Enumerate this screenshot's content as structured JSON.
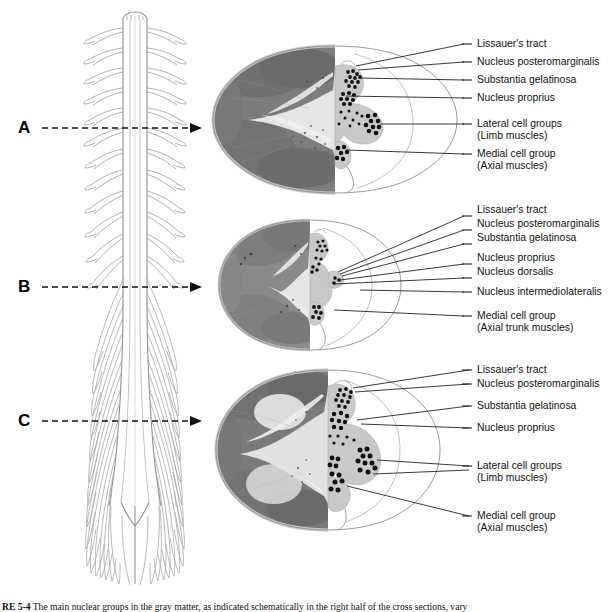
{
  "figure": {
    "caption_number": "RE 5-4",
    "caption_text": "The main nuclear groups in the gray matter, as indicated schematically in the right half of the cross sections, vary"
  },
  "levels": [
    {
      "id": "A",
      "letter": "A",
      "name": "cervical-section",
      "labels": [
        {
          "text": "Lissauer's tract",
          "sub": ""
        },
        {
          "text": "Nucleus posteromarginalis",
          "sub": ""
        },
        {
          "text": "Substantia gelatinosa",
          "sub": ""
        },
        {
          "text": "Nucleus proprius",
          "sub": ""
        },
        {
          "text": "Lateral cell groups",
          "sub": "(Limb muscles)"
        },
        {
          "text": "Medial cell group",
          "sub": "(Axial muscles)"
        }
      ]
    },
    {
      "id": "B",
      "letter": "B",
      "name": "thoracic-section",
      "labels": [
        {
          "text": "Lissauer's tract",
          "sub": ""
        },
        {
          "text": "Nucleus posteromarginalis",
          "sub": ""
        },
        {
          "text": "Substantia gelatinosa",
          "sub": ""
        },
        {
          "text": "Nucleus proprius",
          "sub": ""
        },
        {
          "text": "Nucleus dorsalis",
          "sub": ""
        },
        {
          "text": "Nucleus intermediolateralis",
          "sub": ""
        },
        {
          "text": "Medial cell group",
          "sub": "(Axial trunk muscles)"
        }
      ]
    },
    {
      "id": "C",
      "letter": "C",
      "name": "lumbosacral-section",
      "labels": [
        {
          "text": "Lissauer's tract",
          "sub": ""
        },
        {
          "text": "Nucleus posteromarginalis",
          "sub": ""
        },
        {
          "text": "Substantia gelatinosa",
          "sub": ""
        },
        {
          "text": "Nucleus proprius",
          "sub": ""
        },
        {
          "text": "Lateral cell groups",
          "sub": "(Limb muscles)"
        },
        {
          "text": "Medial cell group",
          "sub": "(Axial muscles)"
        }
      ]
    }
  ],
  "colors": {
    "gray_matter": "#c9c9c9",
    "white_matter_outline": "#8f8f8f",
    "cell_dot": "#111111",
    "leader_line": "#222222",
    "micrograph_dark": "#6b6b6b",
    "micrograph_light": "#d8d8d8"
  }
}
